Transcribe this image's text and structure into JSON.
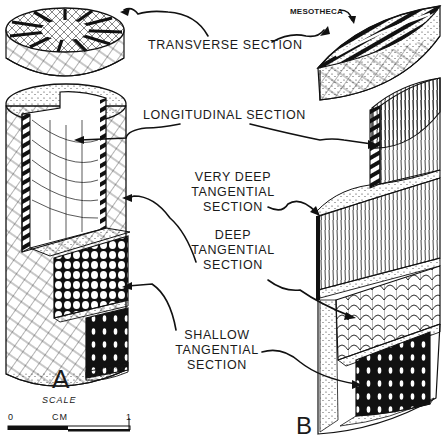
{
  "figure": {
    "labels": {
      "transverse": "TRANSVERSE SECTION",
      "mesotheca": "MESOTHECA",
      "longitudinal": "LONGITUDINAL SECTION",
      "very_deep_line1": "VERY DEEP",
      "very_deep_line2": "TANGENTIAL",
      "very_deep_line3": "SECTION",
      "deep_line1": "DEEP",
      "deep_line2": "TANGENTIAL",
      "deep_line3": "SECTION",
      "shallow_line1": "SHALLOW",
      "shallow_line2": "TANGENTIAL",
      "shallow_line3": "SECTION"
    },
    "specimens": {
      "a": "A",
      "b": "B"
    },
    "scale": {
      "title": "SCALE",
      "start": "0",
      "unit": "CM",
      "end": "1"
    },
    "colors": {
      "ink": "#111111",
      "paper": "#ffffff"
    }
  }
}
